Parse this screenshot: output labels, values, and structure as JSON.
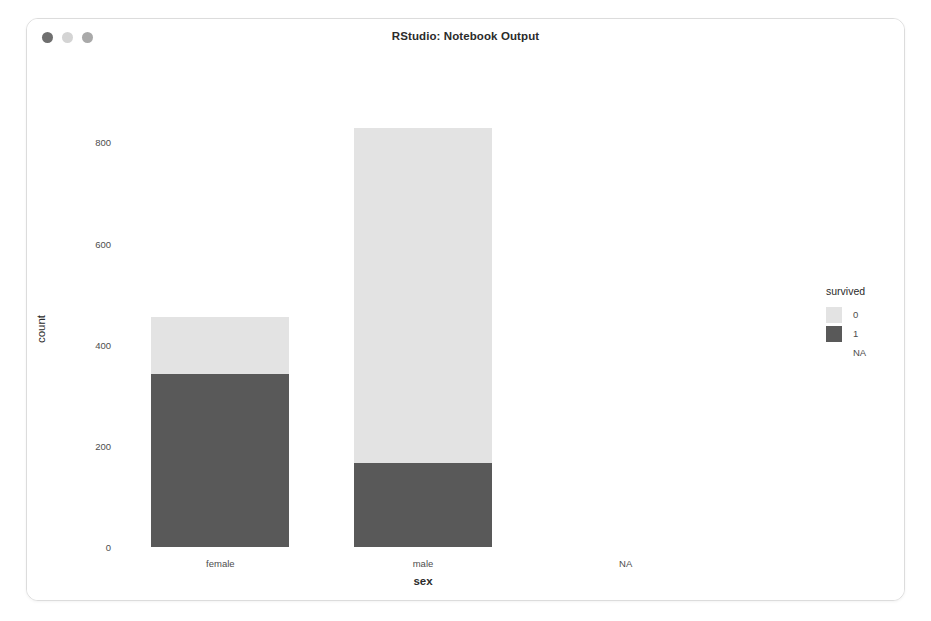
{
  "window": {
    "title": "RStudio: Notebook Output",
    "controls": [
      {
        "name": "close",
        "color": "#6f6f6f"
      },
      {
        "name": "minimize",
        "color": "#d4d4d4"
      },
      {
        "name": "maximize",
        "color": "#a9a9a9"
      }
    ]
  },
  "chart_data": {
    "type": "bar",
    "title": "",
    "subtitle": "",
    "xlabel": "sex",
    "ylabel": "count",
    "categories": [
      "female",
      "male",
      "NA"
    ],
    "yticks": [
      0,
      200,
      400,
      600,
      800
    ],
    "ylim": [
      0,
      860
    ],
    "grid": false,
    "stacked": true,
    "legend": {
      "title": "survived",
      "position": "right",
      "entries": [
        {
          "label": "0",
          "color": "#e3e3e3"
        },
        {
          "label": "1",
          "color": "#595959"
        },
        {
          "label": "NA",
          "color": "#ffffff"
        }
      ]
    },
    "series": [
      {
        "name": "0",
        "color": "#e3e3e3",
        "values": [
          112,
          661,
          0
        ]
      },
      {
        "name": "1",
        "color": "#595959",
        "values": [
          342,
          167,
          0
        ]
      }
    ],
    "totals": [
      454,
      828,
      0
    ]
  }
}
